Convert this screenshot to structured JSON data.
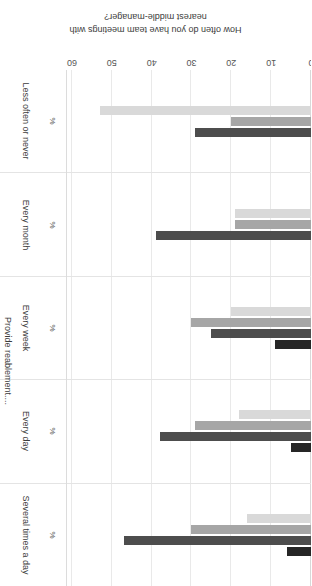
{
  "chart_data": {
    "type": "bar",
    "orientation": "horizontal",
    "title": "How often do you have team meetings with nearest middle-manager?",
    "title_lines": [
      "How often do you have team meetings with",
      "nearest middle-manager?"
    ],
    "xlabel": "",
    "ylabel": "",
    "unit_label": "%",
    "outer_group_label": "Provide reablement....",
    "xlim": [
      0,
      60
    ],
    "ticks": [
      0,
      10,
      20,
      30,
      40,
      50,
      60
    ],
    "tick_labels": [
      "0",
      "10",
      "20",
      "30",
      "40",
      "50",
      "60"
    ],
    "grid": true,
    "legend": "none",
    "categories": [
      "Several times a day",
      "Every day",
      "Every week",
      "Every month",
      "Less often or never"
    ],
    "series": [
      {
        "name": "series-1",
        "color": "#262626",
        "values": [
          6,
          5,
          9,
          null,
          null
        ]
      },
      {
        "name": "series-2",
        "color": "#4d4d4d",
        "values": [
          47,
          38,
          25,
          39,
          29
        ]
      },
      {
        "name": "series-3",
        "color": "#a6a6a6",
        "values": [
          30,
          29,
          30,
          19,
          20
        ]
      },
      {
        "name": "series-4",
        "color": "#d9d9d9",
        "values": [
          16,
          18,
          20,
          19,
          53
        ]
      }
    ],
    "colors": {
      "darkest": "#262626",
      "dark": "#4d4d4d",
      "mid": "#a6a6a6",
      "light": "#d9d9d9",
      "grid": "#e9e9e9",
      "axis": "#d8d8d8",
      "text": "#3c3c3c",
      "background": "#ffffff"
    }
  }
}
